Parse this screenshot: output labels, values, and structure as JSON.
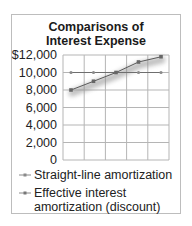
{
  "chart_data": {
    "type": "line",
    "title": "Comparisons of Interest Expense",
    "title_lines": [
      "Comparisons of",
      "Interest Expense"
    ],
    "xlabel": "",
    "ylabel": "",
    "x": [
      1,
      2,
      3,
      4,
      5
    ],
    "ylim": [
      0,
      12000
    ],
    "yticks": [
      0,
      2000,
      4000,
      6000,
      8000,
      10000,
      12000
    ],
    "ytick_labels": [
      "0",
      "2,000",
      "4,000",
      "6,000",
      "8,000",
      "10,000",
      "$12,000"
    ],
    "grid": true,
    "legend_position": "bottom",
    "series": [
      {
        "name": "Straight-line amortization",
        "values": [
          10000,
          10000,
          10000,
          10000,
          10000
        ],
        "color": "#777777",
        "marker": "diamond"
      },
      {
        "name": "Effective interest amortization (discount)",
        "values": [
          8000,
          9000,
          10000,
          11200,
          11800
        ],
        "color": "#555555",
        "marker": "square"
      }
    ]
  },
  "legend": {
    "items": [
      {
        "label": "Straight-line amortization"
      },
      {
        "label_line1": "Effective interest",
        "label_line2": "amortization (discount)"
      }
    ]
  }
}
